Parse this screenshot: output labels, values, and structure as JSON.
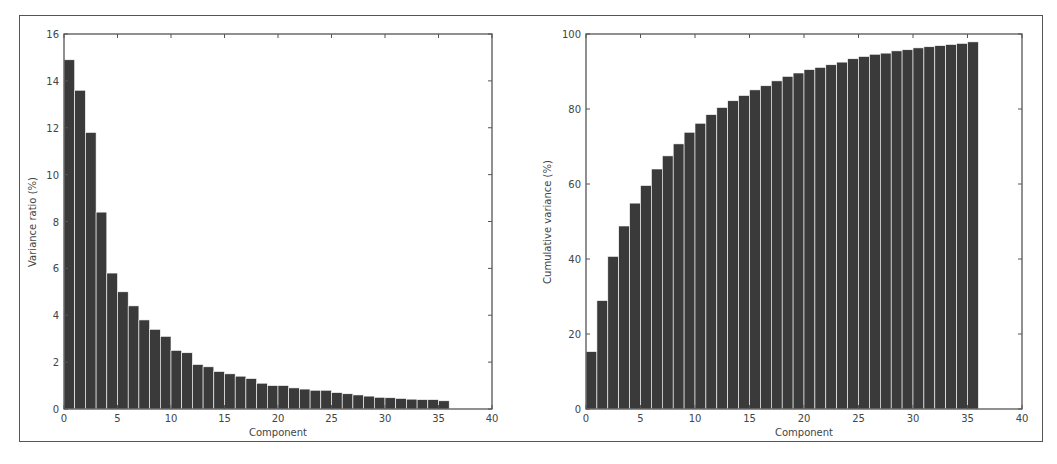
{
  "chart_data": [
    {
      "type": "bar",
      "title": "",
      "xlabel": "Component",
      "ylabel": "Variance ratio (%)",
      "xlim": [
        0,
        40
      ],
      "ylim": [
        0,
        16
      ],
      "xticks": [
        0,
        5,
        10,
        15,
        20,
        25,
        30,
        35,
        40
      ],
      "yticks": [
        0,
        2,
        4,
        6,
        8,
        10,
        12,
        14,
        16
      ],
      "grid": false,
      "x": [
        0,
        1,
        2,
        3,
        4,
        5,
        6,
        7,
        8,
        9,
        10,
        11,
        12,
        13,
        14,
        15,
        16,
        17,
        18,
        19,
        20,
        21,
        22,
        23,
        24,
        25,
        26,
        27,
        28,
        29,
        30,
        31,
        32,
        33,
        34,
        35
      ],
      "values": [
        14.9,
        13.6,
        11.8,
        8.4,
        5.8,
        5.0,
        4.4,
        3.8,
        3.4,
        3.1,
        2.5,
        2.4,
        1.9,
        1.8,
        1.6,
        1.5,
        1.4,
        1.3,
        1.1,
        1.0,
        1.0,
        0.9,
        0.85,
        0.8,
        0.8,
        0.7,
        0.65,
        0.6,
        0.55,
        0.5,
        0.48,
        0.45,
        0.42,
        0.4,
        0.4,
        0.35
      ]
    },
    {
      "type": "bar",
      "title": "",
      "xlabel": "Component",
      "ylabel": "Cumulative variance (%)",
      "xlim": [
        0,
        40
      ],
      "ylim": [
        0,
        100
      ],
      "xticks": [
        0,
        5,
        10,
        15,
        20,
        25,
        30,
        35,
        40
      ],
      "yticks": [
        0,
        20,
        40,
        60,
        80,
        100
      ],
      "grid": false,
      "x": [
        0,
        1,
        2,
        3,
        4,
        5,
        6,
        7,
        8,
        9,
        10,
        11,
        12,
        13,
        14,
        15,
        16,
        17,
        18,
        19,
        20,
        21,
        22,
        23,
        24,
        25,
        26,
        27,
        28,
        29,
        30,
        31,
        32,
        33,
        34,
        35
      ],
      "values": [
        15.3,
        28.9,
        40.7,
        48.8,
        54.9,
        59.6,
        64.0,
        67.5,
        70.7,
        73.8,
        76.2,
        78.5,
        80.4,
        82.2,
        83.6,
        85.1,
        86.2,
        87.5,
        88.7,
        89.6,
        90.5,
        91.1,
        91.8,
        92.5,
        93.4,
        94.0,
        94.6,
        94.9,
        95.5,
        95.8,
        96.3,
        96.6,
        96.9,
        97.2,
        97.5,
        97.9
      ]
    }
  ],
  "style": {
    "bar_color": "#3a3a3a",
    "axis_color": "#555555"
  }
}
